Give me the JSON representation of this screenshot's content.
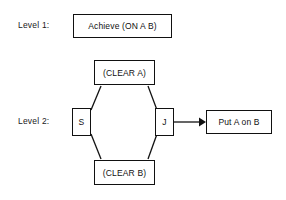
{
  "diagram": {
    "background_color": "#ffffff",
    "stroke_color": "#111111",
    "text_color": "#111111",
    "levels": [
      {
        "id": "level-1",
        "label": "Level 1:"
      },
      {
        "id": "level-2",
        "label": "Level 2:"
      }
    ],
    "nodes": {
      "achieve": {
        "label": "Achieve (ON A B)",
        "shape": "rectangle",
        "level": "Level 1:"
      },
      "clear_a": {
        "label": "(CLEAR A)",
        "shape": "rectangle",
        "level": "Level 2:"
      },
      "clear_b": {
        "label": "(CLEAR B)",
        "shape": "rectangle",
        "level": "Level 2:"
      },
      "split": {
        "label": "S",
        "shape": "rectangle",
        "level": "Level 2:"
      },
      "join": {
        "label": "J",
        "shape": "rectangle",
        "level": "Level 2:"
      },
      "put_a_on_b": {
        "label": "Put A on B",
        "shape": "rectangle",
        "level": "Level 2:"
      }
    },
    "edges": [
      {
        "from": "S",
        "to": "(CLEAR A)",
        "arrow": false
      },
      {
        "from": "(CLEAR A)",
        "to": "J",
        "arrow": false
      },
      {
        "from": "S",
        "to": "(CLEAR B)",
        "arrow": false
      },
      {
        "from": "(CLEAR B)",
        "to": "J",
        "arrow": false
      },
      {
        "from": "J",
        "to": "Put A on B",
        "arrow": true
      }
    ]
  }
}
